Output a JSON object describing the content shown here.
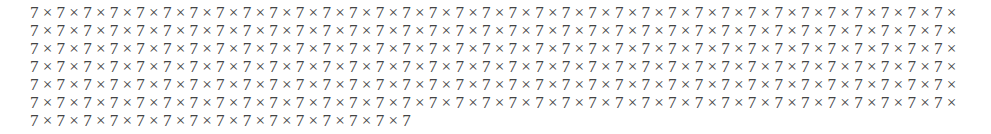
{
  "document": {
    "text": "7 × 7 × 7 × 7 × 7 × 7 × 7 × 7 × 7 × 7 × 7 × 7 × 7 × 7 × 7 × 7 × 7 × 7 × 7 × 7 × 7 × 7 × 7 × 7 × 7 × 7 × 7 × 7 × 7 × 7 × 7 × 7 × 7 × 7 × 7 × 7 × 7 × 7 × 7 × 7 × 7 × 7 × 7 × 7 × 7 × 7 × 7 × 7 × 7 × 7 × 7 × 7 × 7 × 7 × 7 × 7 × 7 × 7 × 7 × 7 × 7 × 7 × 7 × 7 × 7 × 7 × 7 × 7 × 7 × 7 × 7 × 7 × 7 × 7 × 7 × 7 × 7 × 7 × 7 × 7 × 7 × 7 × 7 × 7 × 7 × 7 × 7 × 7 × 7 × 7 × 7 × 7 × 7 × 7 × 7 × 7 × 7 × 7 × 7 × 7 × 7 × 7 × 7 × 7 × 7 × 7 × 7 × 7 × 7 × 7 × 7 × 7 × 7 × 7 × 7 × 7 × 7 × 7 × 7 × 7 × 7 × 7 × 7 × 7 × 7 × 7 × 7 × 7 × 7 × 7 × 7 × 7 × 7 × 7 × 7 × 7 × 7 × 7 × 7 × 7 × 7 × 7 × 7 × 7 × 7 × 7 × 7 × 7 × 7 × 7 × 7 × 7 × 7 × 7 × 7 × 7 × 7 × 7 × 7 × 7 × 7 × 7 × 7 × 7 × 7 × 7 × 7 × 7 × 7 × 7 × 7 × 7 × 7 × 7 × 7 × 7 × 7 × 7 × 7 × 7 × 7 × 7 × 7 × 7 × 7 × 7 × 7 × 7 × 7 × 7 × 7 × 7 × 7 × 7 × 7 × 7 × 7 × 7 × 7 × 7 × 7 × 7 × 7 × 7 × 7 × 7 × 7 × 7 × 7 × 7 × 7 × 7 × 7 × 7 × 7 × 7 × 7 × 7 × 7 × 7 × 7 × 7 × 7 × 7 × 7 × 7 × 7 × 7 × 7 × 7 × 7 × 7 × 7 × 7 × 7 × 7 × 7 × 7 × 7 × 7 × 7 × 7 × 7 × 7 × 7 × 7 × 7",
    "lines": [
      "7 × 7 × 7 × 7 × 7 × 7 × 7 × 7 × 7 × 7 × 7 × 7 × 7 × 7 × 7 × 7 × 7 × 7 × 7 × 7 × 7 × 7 × 7 × 7 × 7 × 7 × 7 × 7 × 7 × 7 × 7 × 7 × 7 × 7 × 7 ×",
      "7 × 7 × 7 × 7 × 7 × 7 × 7 × 7 × 7 × 7 × 7 × 7 × 7 × 7 × 7 × 7 × 7 × 7 × 7 × 7 × 7 × 7 × 7 × 7 × 7 × 7 × 7 × 7 × 7 × 7 × 7 × 7 × 7 × 7 × 7 ×",
      "7 × 7 × 7 × 7 × 7 × 7 × 7 × 7 × 7 × 7 × 7 × 7 × 7 × 7 × 7 × 7 × 7 × 7 × 7 × 7 × 7 × 7 × 7 × 7 × 7 × 7 × 7 × 7 × 7 × 7 × 7 × 7 × 7 × 7 × 7 ×",
      "7 × 7 × 7 × 7 × 7 × 7 × 7 × 7 × 7 × 7 × 7 × 7 × 7 × 7 × 7 × 7 × 7 × 7 × 7 × 7 × 7 × 7 × 7 × 7 × 7 × 7 × 7 × 7 × 7 × 7 × 7 × 7 × 7 × 7 × 7 ×",
      "7 × 7 × 7 × 7 × 7 × 7 × 7 × 7 × 7 × 7 × 7 × 7 × 7 × 7 × 7 × 7 × 7 × 7 × 7 × 7 × 7 × 7 × 7 × 7 × 7 × 7 × 7 × 7 × 7 × 7 × 7 × 7 × 7 × 7 × 7 ×",
      "7 × 7 × 7 × 7 × 7 × 7 × 7 × 7 × 7 × 7 × 7 × 7 × 7 × 7 × 7 × 7 × 7 × 7 × 7 × 7 × 7 × 7 × 7 × 7 × 7 × 7 × 7 × 7 × 7 × 7 × 7 × 7 × 7 × 7 × 7 ×",
      "7 × 7 × 7 × 7 × 7 × 7 × 7 × 7 × 7 × 7 × 7 × 7 × 7 × 7 × 7"
    ],
    "text_color": "#444444"
  }
}
